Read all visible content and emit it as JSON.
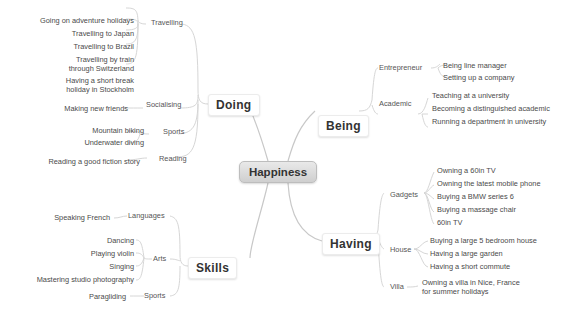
{
  "root": {
    "label": "Happiness"
  },
  "doing": {
    "label": "Doing",
    "travelling": {
      "label": "Travelling",
      "items": [
        "Going on adventure holidays",
        "Travelling to Japan",
        "Travelling to Brazil",
        "Travelling by train through Switzerland",
        "Having a short break holiday in Stockholm"
      ],
      "item3_line1": "Travelling by train",
      "item3_line2": "through Switzerland",
      "item4_line1": "Having a short break",
      "item4_line2": "holiday in Stockholm"
    },
    "socialising": {
      "label": "Socialising",
      "items": [
        "Making new friends"
      ]
    },
    "sports": {
      "label": "Sports",
      "items": [
        "Mountain biking",
        "Underwater diving"
      ]
    },
    "reading": {
      "label": "Reading",
      "items": [
        "Reading a good fiction story"
      ]
    }
  },
  "being": {
    "label": "Being",
    "entrepreneur": {
      "label": "Entrepreneur",
      "items": [
        "Being line manager",
        "Setting up a company"
      ]
    },
    "academic": {
      "label": "Academic",
      "items": [
        "Teaching at a university",
        "Becoming a distinguished academic",
        "Running a department in university"
      ]
    }
  },
  "having": {
    "label": "Having",
    "gadgets": {
      "label": "Gadgets",
      "items": [
        "Owning a 60in TV",
        "Owning the latest mobile phone",
        "Buying a BMW series 6",
        "Buying a massage chair",
        "60in TV"
      ]
    },
    "house": {
      "label": "House",
      "items": [
        "Buying a large 5 bedroom house",
        "Having a large garden",
        "Having a short commute"
      ]
    },
    "villa": {
      "label": "Villa",
      "items": [
        "Owning a villa in Nice, France for summer holidays"
      ],
      "item0_line1": "Owning a villa in Nice, France",
      "item0_line2": "for summer holidays"
    }
  },
  "skills": {
    "label": "Skills",
    "languages": {
      "label": "Languages",
      "items": [
        "Speaking French"
      ]
    },
    "arts": {
      "label": "Arts",
      "items": [
        "Dancing",
        "Playing violin",
        "Singing",
        "Mastering studio photography"
      ]
    },
    "sports": {
      "label": "Sports",
      "items": [
        "Paragliding"
      ]
    }
  },
  "colors": {
    "root_gradient_top": "#e9e9e9",
    "root_gradient_bottom": "#cfcfcf",
    "connector": "#d6d6d6",
    "text": "#4a4a4a"
  }
}
